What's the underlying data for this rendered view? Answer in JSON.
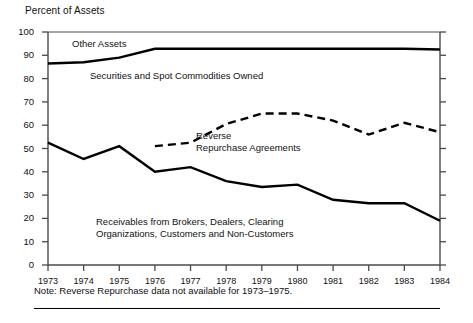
{
  "figure": {
    "axis_title": "Percent of Assets",
    "note": "Note: Reverse Repurchase data not available for 1973–1975."
  },
  "labels": {
    "other_assets": "Other Assets",
    "securities": "Securities and Spot Commodities Owned",
    "reverse_line1": "Reverse",
    "reverse_line2": "Repurchase Agreements",
    "receivables_line1": "Receivables from Brokers, Dealers, Clearing",
    "receivables_line2": "Organizations, Customers and Non-Customers"
  },
  "axes": {
    "y_ticks": [
      "100",
      "90",
      "80",
      "70",
      "60",
      "50",
      "40",
      "30",
      "20",
      "10",
      "0"
    ],
    "x_ticks": [
      "1973",
      "1974",
      "1975",
      "1976",
      "1977",
      "1978",
      "1979",
      "1980",
      "1981",
      "1982",
      "1983",
      "1984"
    ]
  },
  "chart_data": {
    "type": "line",
    "title": "Percent of Assets",
    "xlabel": "",
    "ylabel": "Percent of Assets",
    "ylim": [
      0,
      100
    ],
    "xlim": [
      1973,
      1984
    ],
    "grid": false,
    "legend": "inline-annotations",
    "x": [
      1973,
      1974,
      1975,
      1976,
      1977,
      1978,
      1979,
      1980,
      1981,
      1982,
      1983,
      1984
    ],
    "series": [
      {
        "name": "Other Assets",
        "style": "solid",
        "color": "#000000",
        "values": [
          86.5,
          87.0,
          89.0,
          92.8,
          92.8,
          92.8,
          92.8,
          92.8,
          92.8,
          92.8,
          92.8,
          92.5
        ]
      },
      {
        "name": "Reverse Repurchase Agreements",
        "style": "dashed",
        "color": "#000000",
        "values": [
          null,
          null,
          null,
          51.0,
          52.5,
          60.5,
          65.0,
          65.0,
          62.0,
          56.0,
          61.0,
          57.0
        ]
      },
      {
        "name": "Receivables from Brokers, Dealers, Clearing Organizations, Customers and Non-Customers",
        "style": "solid",
        "color": "#000000",
        "values": [
          52.5,
          45.5,
          51.0,
          40.0,
          42.0,
          36.0,
          33.5,
          34.5,
          28.0,
          26.5,
          26.5,
          19.0
        ]
      }
    ],
    "annotations": [
      {
        "text": "Other Assets",
        "x": 1974.3,
        "y": 96
      },
      {
        "text": "Securities and Spot Commodities Owned",
        "x": 1975.0,
        "y": 78
      },
      {
        "text": "Reverse Repurchase Agreements",
        "x": 1979.0,
        "y": 55
      },
      {
        "text": "Receivables from Brokers, Dealers, Clearing Organizations, Customers and Non-Customers",
        "x": 1975.2,
        "y": 20
      }
    ]
  },
  "geometry": {
    "plot_left": 48,
    "plot_right": 440,
    "plot_top": 32,
    "plot_bottom": 265
  }
}
